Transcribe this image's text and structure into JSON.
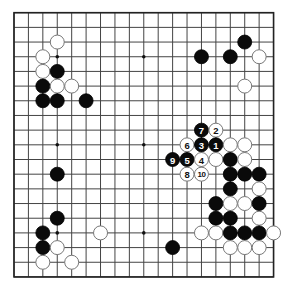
{
  "board": {
    "size": 19,
    "origin_x": 14,
    "origin_y": 12.7,
    "spacing_x": 14.42,
    "spacing_y": 14.68,
    "stone_radius": 7,
    "colors": {
      "line": "#444444",
      "black_stone": "#0a0a0a",
      "white_stone": "#ffffff",
      "white_outline": "#777777",
      "background": "#ffffff"
    },
    "star_points": [
      [
        3,
        3
      ],
      [
        9,
        3
      ],
      [
        15,
        3
      ],
      [
        3,
        9
      ],
      [
        9,
        9
      ],
      [
        15,
        9
      ],
      [
        3,
        15
      ],
      [
        9,
        15
      ],
      [
        15,
        15
      ]
    ],
    "stones": [
      {
        "color": "white",
        "col": 3,
        "row": 2
      },
      {
        "color": "white",
        "col": 2,
        "row": 3
      },
      {
        "color": "white",
        "col": 2,
        "row": 4
      },
      {
        "color": "black",
        "col": 3,
        "row": 4
      },
      {
        "color": "black",
        "col": 2,
        "row": 5
      },
      {
        "color": "white",
        "col": 3,
        "row": 5
      },
      {
        "color": "white",
        "col": 4,
        "row": 5
      },
      {
        "color": "black",
        "col": 2,
        "row": 6
      },
      {
        "color": "black",
        "col": 3,
        "row": 6
      },
      {
        "color": "black",
        "col": 5,
        "row": 6
      },
      {
        "color": "black",
        "col": 16,
        "row": 2
      },
      {
        "color": "black",
        "col": 13,
        "row": 3
      },
      {
        "color": "black",
        "col": 15,
        "row": 3
      },
      {
        "color": "white",
        "col": 17,
        "row": 3
      },
      {
        "color": "white",
        "col": 16,
        "row": 5
      },
      {
        "color": "black",
        "col": 13,
        "row": 8,
        "label": "7"
      },
      {
        "color": "white",
        "col": 14,
        "row": 8,
        "label": "2"
      },
      {
        "color": "white",
        "col": 12,
        "row": 9,
        "label": "6"
      },
      {
        "color": "black",
        "col": 13,
        "row": 9,
        "label": "3"
      },
      {
        "color": "black",
        "col": 14,
        "row": 9,
        "label": "1"
      },
      {
        "color": "white",
        "col": 15,
        "row": 9
      },
      {
        "color": "white",
        "col": 16,
        "row": 9
      },
      {
        "color": "black",
        "col": 11,
        "row": 10,
        "label": "9"
      },
      {
        "color": "black",
        "col": 12,
        "row": 10,
        "label": "5"
      },
      {
        "color": "white",
        "col": 13,
        "row": 10,
        "label": "4"
      },
      {
        "color": "white",
        "col": 14,
        "row": 10
      },
      {
        "color": "black",
        "col": 15,
        "row": 10
      },
      {
        "color": "white",
        "col": 16,
        "row": 10
      },
      {
        "color": "white",
        "col": 12,
        "row": 11,
        "label": "8"
      },
      {
        "color": "white",
        "col": 13,
        "row": 11,
        "label": "10"
      },
      {
        "color": "black",
        "col": 15,
        "row": 11
      },
      {
        "color": "black",
        "col": 16,
        "row": 11
      },
      {
        "color": "black",
        "col": 17,
        "row": 11
      },
      {
        "color": "black",
        "col": 15,
        "row": 12
      },
      {
        "color": "white",
        "col": 17,
        "row": 12
      },
      {
        "color": "black",
        "col": 14,
        "row": 13
      },
      {
        "color": "white",
        "col": 15,
        "row": 13
      },
      {
        "color": "white",
        "col": 16,
        "row": 13
      },
      {
        "color": "black",
        "col": 17,
        "row": 13
      },
      {
        "color": "black",
        "col": 14,
        "row": 14
      },
      {
        "color": "black",
        "col": 15,
        "row": 14
      },
      {
        "color": "white",
        "col": 17,
        "row": 14
      },
      {
        "color": "white",
        "col": 13,
        "row": 15
      },
      {
        "color": "white",
        "col": 14,
        "row": 15
      },
      {
        "color": "black",
        "col": 15,
        "row": 15
      },
      {
        "color": "black",
        "col": 16,
        "row": 15
      },
      {
        "color": "black",
        "col": 17,
        "row": 15
      },
      {
        "color": "white",
        "col": 18,
        "row": 15
      },
      {
        "color": "white",
        "col": 15,
        "row": 16
      },
      {
        "color": "white",
        "col": 16,
        "row": 16
      },
      {
        "color": "white",
        "col": 17,
        "row": 16
      },
      {
        "color": "black",
        "col": 11,
        "row": 16
      },
      {
        "color": "black",
        "col": 3,
        "row": 11
      },
      {
        "color": "black",
        "col": 3,
        "row": 14
      },
      {
        "color": "black",
        "col": 2,
        "row": 15
      },
      {
        "color": "white",
        "col": 6,
        "row": 15
      },
      {
        "color": "black",
        "col": 2,
        "row": 16
      },
      {
        "color": "white",
        "col": 3,
        "row": 16
      },
      {
        "color": "white",
        "col": 2,
        "row": 17
      },
      {
        "color": "white",
        "col": 4,
        "row": 17
      }
    ]
  }
}
